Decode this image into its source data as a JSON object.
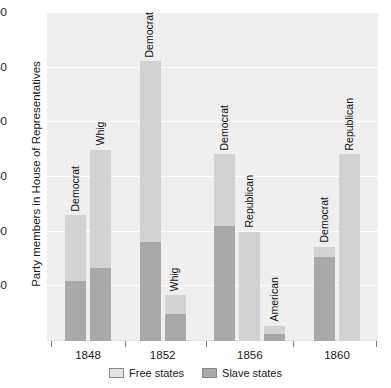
{
  "chart_data": {
    "type": "bar",
    "subtype": "grouped-stacked",
    "title": "",
    "xlabel": "",
    "ylabel": "Party members in House of Representatives",
    "ylim": [
      0,
      300
    ],
    "yticks": [
      50,
      100,
      150,
      200,
      250,
      300
    ],
    "grid": true,
    "legend_position": "bottom",
    "categories": [
      "1848",
      "1852",
      "1856",
      "1860"
    ],
    "series": [
      {
        "name": "Free states",
        "color": "#d2d2d2"
      },
      {
        "name": "Slave states",
        "color": "#a9a9a9"
      }
    ],
    "bars": [
      {
        "year": "1848",
        "party": "Democrat",
        "slave_states": 55,
        "free_states": 60,
        "total": 115
      },
      {
        "year": "1848",
        "party": "Whig",
        "slave_states": 67,
        "free_states": 108,
        "total": 175
      },
      {
        "year": "1852",
        "party": "Democrat",
        "slave_states": 91,
        "free_states": 165,
        "total": 256
      },
      {
        "year": "1852",
        "party": "Whig",
        "slave_states": 25,
        "free_states": 17,
        "total": 42
      },
      {
        "year": "1856",
        "party": "Democrat",
        "slave_states": 105,
        "free_states": 66,
        "total": 171
      },
      {
        "year": "1856",
        "party": "Republican",
        "slave_states": 0,
        "free_states": 100,
        "total": 100
      },
      {
        "year": "1856",
        "party": "American",
        "slave_states": 6,
        "free_states": 8,
        "total": 14
      },
      {
        "year": "1860",
        "party": "Democrat",
        "slave_states": 77,
        "free_states": 9,
        "total": 86
      },
      {
        "year": "1860",
        "party": "Republican",
        "slave_states": 0,
        "free_states": 171,
        "total": 171
      }
    ]
  },
  "axis": {
    "y_title": "Party members in House of Representatives",
    "y_tick_labels": [
      "300",
      "250",
      "200",
      "150",
      "100",
      "50"
    ],
    "x_tick_labels": [
      "1848",
      "1852",
      "1856",
      "1860"
    ]
  },
  "legend": {
    "items": [
      {
        "label": "Free states",
        "color": "#e4e4e4"
      },
      {
        "label": "Slave states",
        "color": "#a9a9a9"
      }
    ]
  },
  "bar_labels": [
    "Democrat",
    "Whig",
    "Democrat",
    "Whig",
    "Democrat",
    "Republican",
    "American",
    "Democrat",
    "Republican"
  ]
}
